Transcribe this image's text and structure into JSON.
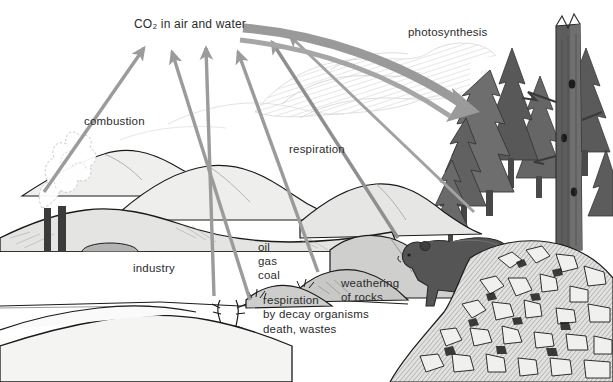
{
  "diagram": {
    "width": 613,
    "height": 382,
    "background_color": "#ffffff"
  },
  "labels": {
    "co2_pool": "CO₂ in air and water",
    "photosynthesis": "photosynthesis",
    "combustion": "combustion",
    "respiration": "respiration",
    "industry": "industry",
    "fossil_fuels": "oil\ngas\ncoal",
    "respiration_decay": "respiration\nby decay organisms",
    "death_wastes": "death, wastes",
    "weathering": "weathering\nof rocks"
  },
  "colors": {
    "ink": "#2b2b2b",
    "outline": "#1a1a1a",
    "arrow_gray": "#9b9b9b",
    "arrow_gray_dark": "#8a8a8a",
    "photosynthesis_arrow": "#9a9a9a",
    "mountain_light": "#efefee",
    "mountain_mid": "#dcdcdb",
    "mountain_shade": "#cfcfce",
    "foreground_hill": "#f2f2f1",
    "tree_dark": "#4d4d4d",
    "tree_mid": "#6b6b6b",
    "snag_trunk": "#5d5d5d",
    "bear_body": "#555555",
    "smokestack": "#3b3b3b",
    "tank_gray": "#a8a8a8",
    "train_dark": "#1f1f1f",
    "rock_light": "#e2e2e1",
    "rock_dark": "#2a2a2a",
    "cloud_haze": "#d8d8d8"
  },
  "flows": [
    {
      "name": "combustion",
      "from": "industry",
      "to": "co2_pool",
      "direction": "up"
    },
    {
      "name": "respiration",
      "from": "organisms",
      "to": "co2_pool",
      "direction": "up"
    },
    {
      "name": "respiration-by-decay",
      "from": "decay-organisms",
      "to": "co2_pool",
      "direction": "up"
    },
    {
      "name": "weathering-of-rocks",
      "from": "rocks",
      "to": "co2_pool",
      "direction": "up"
    },
    {
      "name": "animal-respiration",
      "from": "bear",
      "to": "co2_pool",
      "direction": "up"
    },
    {
      "name": "photosynthesis",
      "from": "co2_pool",
      "to": "forest",
      "direction": "down-right"
    }
  ],
  "scene_elements": [
    {
      "name": "factory",
      "label": "industry"
    },
    {
      "name": "smokestacks",
      "count": 2
    },
    {
      "name": "storage-tanks",
      "count": 2
    },
    {
      "name": "train",
      "label": "freight train"
    },
    {
      "name": "mountain-range",
      "label": "background mountains"
    },
    {
      "name": "underground-layer",
      "label": "oil gas coal"
    },
    {
      "name": "deer-carcass",
      "label": "death, wastes"
    },
    {
      "name": "bear",
      "label": "animal"
    },
    {
      "name": "conifer-forest",
      "label": "trees"
    },
    {
      "name": "dead-snag",
      "label": "standing dead tree"
    },
    {
      "name": "rocky-scree",
      "label": "weathering of rocks"
    }
  ]
}
